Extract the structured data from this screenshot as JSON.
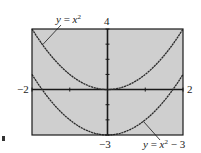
{
  "chart_data": {
    "type": "line",
    "title": "",
    "xlabel": "",
    "ylabel": "",
    "xlim": [
      -2,
      2
    ],
    "ylim": [
      -3,
      4
    ],
    "grid": false,
    "x_ticks": [
      -2,
      -1,
      0,
      1,
      2
    ],
    "y_ticks": [
      -3,
      -2,
      -1,
      0,
      1,
      2,
      3,
      4
    ],
    "window_labels": {
      "xmin": "−2",
      "xmax": "2",
      "ymin": "−3",
      "ymax": "4"
    },
    "series": [
      {
        "name": "y = x^2",
        "label": "y = x²",
        "function": "x^2",
        "x": [
          -2,
          -1.5,
          -1,
          -0.5,
          0,
          0.5,
          1,
          1.5,
          2
        ],
        "values": [
          4,
          2.25,
          1,
          0.25,
          0,
          0.25,
          1,
          2.25,
          4
        ]
      },
      {
        "name": "y = x^2 - 3",
        "label": "y = x² − 3",
        "function": "x^2 - 3",
        "x": [
          -2,
          -1.5,
          -1,
          -0.5,
          0,
          0.5,
          1,
          1.5,
          2
        ],
        "values": [
          1,
          -0.75,
          -2,
          -2.75,
          -3,
          -2.75,
          -2,
          -0.75,
          1
        ]
      }
    ],
    "annotations": [
      {
        "text": "y = x²",
        "points_to": "upper-left branch of y = x²"
      },
      {
        "text": "y = x² − 3",
        "points_to": "right branch of y = x² − 3"
      }
    ]
  },
  "labels": {
    "curve1": {
      "y": "y",
      "eq": " = ",
      "x": "x",
      "exp": "2",
      "tail": ""
    },
    "curve2": {
      "y": "y",
      "eq": " = ",
      "x": "x",
      "exp": "2",
      "tail": " − 3"
    },
    "ymax": "4",
    "ymin": "−3",
    "xmin": "−2",
    "xmax": "2"
  },
  "colors": {
    "plot_background": "#cfcfcf",
    "axis": "#1a1a1a",
    "curve": "#2a2a2a",
    "frame": "#1a1a1a"
  }
}
